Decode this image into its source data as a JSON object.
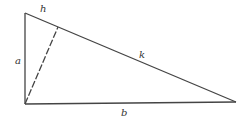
{
  "diagram": {
    "type": "right-triangle-with-altitude",
    "vertices": {
      "top": {
        "x": 25,
        "y": 13
      },
      "right_angle": {
        "x": 25,
        "y": 104
      },
      "right": {
        "x": 236,
        "y": 102
      },
      "altitude_foot": {
        "x": 58,
        "y": 27
      }
    },
    "labels": {
      "h": "h",
      "k": "k",
      "a": "a",
      "b": "b"
    },
    "colors": {
      "line": "#444444",
      "background": "#ffffff"
    }
  }
}
